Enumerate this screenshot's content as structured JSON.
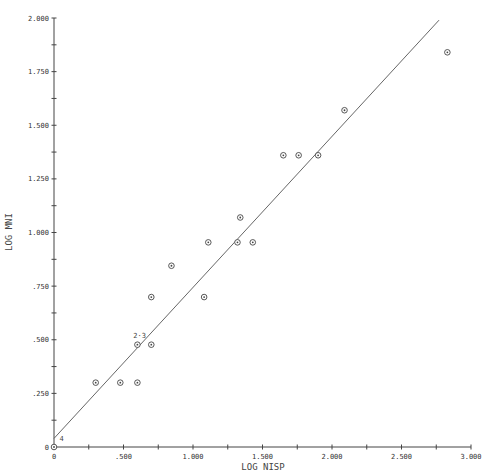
{
  "chart_data": {
    "type": "scatter",
    "title": "",
    "xlabel": "LOG NISP",
    "ylabel": "LOG MNI",
    "xlim": [
      0,
      3.0
    ],
    "ylim": [
      0,
      2.0
    ],
    "grid": false,
    "x_ticks": [
      "0",
      ".500",
      "1.000",
      "1.500",
      "2.000",
      "2.500",
      "3.000"
    ],
    "x_tick_values": [
      0,
      0.5,
      1.0,
      1.5,
      2.0,
      2.5,
      3.0
    ],
    "y_ticks": [
      "0",
      ".250",
      ".500",
      ".750",
      "1.000",
      "1.250",
      "1.500",
      "1.750",
      "2.000"
    ],
    "y_tick_values": [
      0,
      0.25,
      0.5,
      0.75,
      1.0,
      1.25,
      1.5,
      1.75,
      2.0
    ],
    "series": [
      {
        "name": "samples",
        "marker": "circled-dot",
        "points": [
          {
            "x": 0.0,
            "y": 0.0
          },
          {
            "x": 0.3,
            "y": 0.3
          },
          {
            "x": 0.477,
            "y": 0.3
          },
          {
            "x": 0.6,
            "y": 0.3
          },
          {
            "x": 0.6,
            "y": 0.477
          },
          {
            "x": 0.7,
            "y": 0.477
          },
          {
            "x": 0.7,
            "y": 0.699
          },
          {
            "x": 0.845,
            "y": 0.845
          },
          {
            "x": 1.08,
            "y": 0.699
          },
          {
            "x": 1.11,
            "y": 0.954
          },
          {
            "x": 1.32,
            "y": 0.954
          },
          {
            "x": 1.43,
            "y": 0.954
          },
          {
            "x": 1.34,
            "y": 1.07
          },
          {
            "x": 1.65,
            "y": 1.36
          },
          {
            "x": 1.76,
            "y": 1.36
          },
          {
            "x": 1.9,
            "y": 1.36
          },
          {
            "x": 2.09,
            "y": 1.57
          },
          {
            "x": 2.83,
            "y": 1.84
          }
        ]
      },
      {
        "name": "regression line",
        "type": "line",
        "points": [
          {
            "x": 0.0,
            "y": 0.04
          },
          {
            "x": 2.77,
            "y": 1.99
          }
        ]
      }
    ],
    "annotations": [
      {
        "text": "2·3",
        "x": 0.57,
        "y": 0.51
      },
      {
        "text": "4",
        "x": 0.04,
        "y": 0.03
      }
    ]
  }
}
